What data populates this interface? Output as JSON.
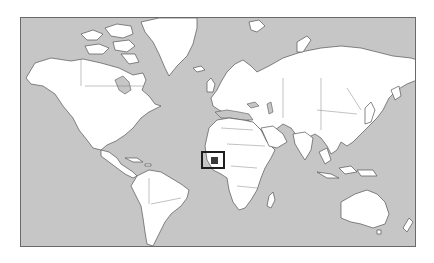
{
  "map": {
    "type": "world-locator-map",
    "projection": "Mercator",
    "colors": {
      "ocean": "#c6c6c6",
      "land": "#ffffff",
      "coastline": "#555555",
      "highlight_box": "#1e1e1e",
      "highlight_fill": "#3a3a3a"
    },
    "frame": {
      "x": 20,
      "y": 17,
      "width": 396,
      "height": 230
    },
    "highlight": {
      "region": "West Africa (Gulf of Guinea)",
      "box": {
        "x": 200,
        "y": 150,
        "width": 24,
        "height": 18
      }
    }
  }
}
